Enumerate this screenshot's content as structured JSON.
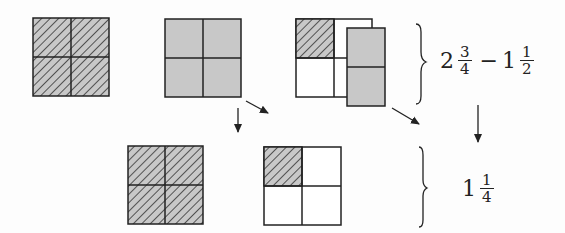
{
  "diagram": {
    "top_row": {
      "whole_square": {
        "parts": 4,
        "shaded": 4,
        "pattern": "hatched"
      },
      "gray_square": {
        "parts": 4,
        "shaded": 4,
        "pattern": "gray"
      },
      "combined": {
        "base_parts": 4,
        "hatched": 1,
        "overlay_parts": 2,
        "overlay_pattern": "gray"
      }
    },
    "bottom_row": {
      "whole_square": {
        "parts": 4,
        "shaded": 4,
        "pattern": "hatched"
      },
      "result_square": {
        "parts": 4,
        "hatched": 1
      }
    },
    "expression_top": {
      "whole1": "2",
      "num1": "3",
      "den1": "4",
      "operator": "−",
      "whole2": "1",
      "num2": "1",
      "den2": "2"
    },
    "expression_bottom": {
      "whole": "1",
      "num": "1",
      "den": "4"
    },
    "colors": {
      "gray": "#c8c8c8",
      "line": "#222222",
      "hatch": "#333333"
    }
  }
}
